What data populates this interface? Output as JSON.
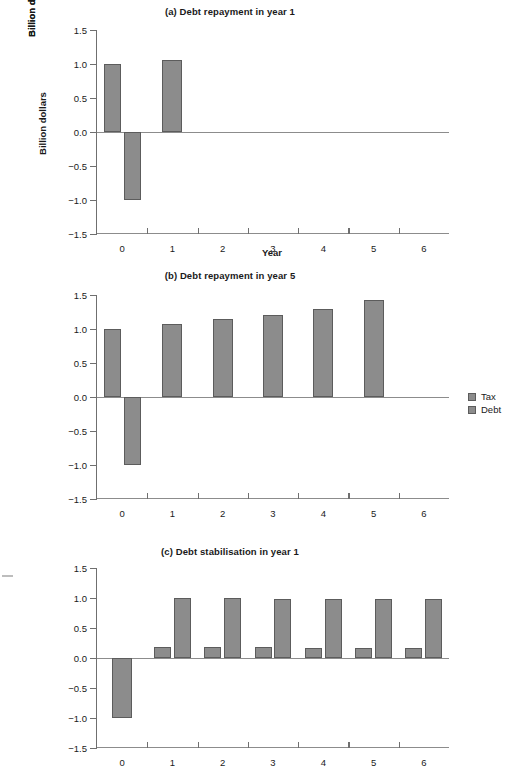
{
  "figure": {
    "y_axis_label": "Billion dollars",
    "x_axis_label": "Year",
    "y_ticks": [
      "1.5",
      "1.0",
      "0.5",
      "0.0",
      "−0.5",
      "−1.0",
      "−1.5"
    ],
    "x_ticks": [
      "0",
      "1",
      "2",
      "3",
      "4",
      "5",
      "6"
    ],
    "bar_color": "#8c8c8c",
    "bar_border_color": "#5c5c5c",
    "axis_color": "#8c8c8c"
  },
  "legend": {
    "items": [
      {
        "label": "Tax",
        "color": "#8c8c8c"
      },
      {
        "label": "Debt",
        "color": "#8c8c8c"
      }
    ]
  },
  "panels": [
    {
      "id": "a",
      "title": "(a) Debt repayment in year 1",
      "show_xlabel": true
    },
    {
      "id": "b",
      "title": "(b) Debt repayment in year 5",
      "show_xlabel": true
    },
    {
      "id": "c",
      "title": "(c) Debt stabilisation in year 1",
      "show_xlabel": false
    }
  ],
  "chart_data": [
    {
      "type": "bar",
      "title": "(a) Debt repayment in year 1",
      "xlabel": "Year",
      "ylabel": "Billion dollars",
      "categories": [
        "0",
        "1",
        "2",
        "3",
        "4",
        "5",
        "6"
      ],
      "ylim": [
        -1.5,
        1.5
      ],
      "yticks": [
        -1.5,
        -1.0,
        -0.5,
        0.0,
        0.5,
        1.0,
        1.5
      ],
      "grid": false,
      "legend_position": "right",
      "series": [
        {
          "name": "Tax",
          "values": [
            1.0,
            1.06,
            0,
            0,
            0,
            0,
            0
          ]
        },
        {
          "name": "Debt",
          "values": [
            -1.0,
            0,
            0,
            0,
            0,
            0,
            0
          ]
        }
      ]
    },
    {
      "type": "bar",
      "title": "(b) Debt repayment in year 5",
      "xlabel": "Year",
      "ylabel": "Billion dollars",
      "categories": [
        "0",
        "1",
        "2",
        "3",
        "4",
        "5",
        "6"
      ],
      "ylim": [
        -1.5,
        1.5
      ],
      "yticks": [
        -1.5,
        -1.0,
        -0.5,
        0.0,
        0.5,
        1.0,
        1.5
      ],
      "grid": false,
      "legend_position": "right",
      "series": [
        {
          "name": "Tax",
          "values": [
            1.0,
            1.07,
            1.15,
            1.2,
            1.29,
            1.43,
            0
          ]
        },
        {
          "name": "Debt",
          "values": [
            -1.0,
            0,
            0,
            0,
            0,
            0,
            0
          ]
        }
      ]
    },
    {
      "type": "bar",
      "title": "(c) Debt stabilisation in year 1",
      "xlabel": "Year",
      "ylabel": "Billion dollars",
      "categories": [
        "0",
        "1",
        "2",
        "3",
        "4",
        "5",
        "6"
      ],
      "ylim": [
        -1.5,
        1.5
      ],
      "yticks": [
        -1.5,
        -1.0,
        -0.5,
        0.0,
        0.5,
        1.0,
        1.5
      ],
      "grid": false,
      "legend_position": "right",
      "series": [
        {
          "name": "Tax",
          "values": [
            0,
            0.19,
            0.18,
            0.18,
            0.17,
            0.17,
            0.17
          ]
        },
        {
          "name": "Debt",
          "values": [
            -1.0,
            1.0,
            1.0,
            0.99,
            0.99,
            0.99,
            0.99
          ]
        }
      ]
    }
  ]
}
